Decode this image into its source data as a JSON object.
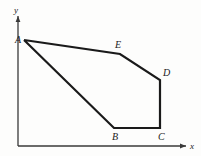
{
  "figure": {
    "caption": "",
    "background_color": "#fdfdfc",
    "stroke_color": "#1a1a1a",
    "axis_color": "#3a3a3a",
    "polygon_stroke_width": 2.2,
    "axis_stroke_width": 1.3
  },
  "axes": {
    "x_label": "x",
    "y_label": "y",
    "origin": {
      "x": 18,
      "y": 146
    },
    "x_end": {
      "x": 186,
      "y": 146
    },
    "y_end": {
      "x": 18,
      "y": 16
    },
    "x_label_pos": {
      "x": 190,
      "y": 141
    },
    "y_label_pos": {
      "x": 14,
      "y": 5
    }
  },
  "chart_data": {
    "type": "scatter",
    "title": "",
    "xlabel": "x",
    "ylabel": "y",
    "grid": false,
    "legend": "none",
    "shape": "closed-polygon",
    "vertex_order": [
      "A",
      "E",
      "D",
      "C",
      "B",
      "A"
    ],
    "vertices": [
      {
        "label": "A",
        "x": 24,
        "y": 40,
        "label_x": 15,
        "label_y": 35
      },
      {
        "label": "E",
        "x": 120,
        "y": 54,
        "label_x": 115,
        "label_y": 40
      },
      {
        "label": "D",
        "x": 160,
        "y": 80,
        "label_x": 163,
        "label_y": 68
      },
      {
        "label": "C",
        "x": 160,
        "y": 128,
        "label_x": 158,
        "label_y": 132
      },
      {
        "label": "B",
        "x": 114,
        "y": 128,
        "label_x": 112,
        "label_y": 132
      }
    ],
    "edges": [
      {
        "from": "A",
        "to": "E"
      },
      {
        "from": "E",
        "to": "D"
      },
      {
        "from": "D",
        "to": "C"
      },
      {
        "from": "C",
        "to": "B"
      },
      {
        "from": "B",
        "to": "A"
      }
    ]
  },
  "labels": {
    "A": "A",
    "B": "B",
    "C": "C",
    "D": "D",
    "E": "E"
  }
}
